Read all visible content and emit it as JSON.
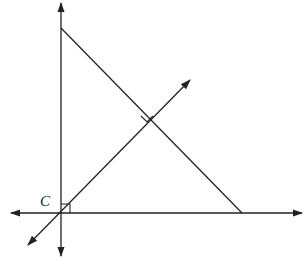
{
  "diagram": {
    "type": "geometry",
    "labels": [
      {
        "id": "C",
        "text": "C"
      }
    ],
    "elements": {
      "horizontal_axis": "double-headed arrow line",
      "vertical_axis": "double-headed arrow line",
      "hypotenuse": "segment from top of vertical axis to horizontal axis",
      "perpendicular_line": "double-headed arrow line through C perpendicular to hypotenuse",
      "right_angle_marks": [
        "at C between axes",
        "at intersection of perpendicular line and hypotenuse"
      ]
    },
    "colors": {
      "stroke": "#222222",
      "background": "#ffffff"
    }
  }
}
